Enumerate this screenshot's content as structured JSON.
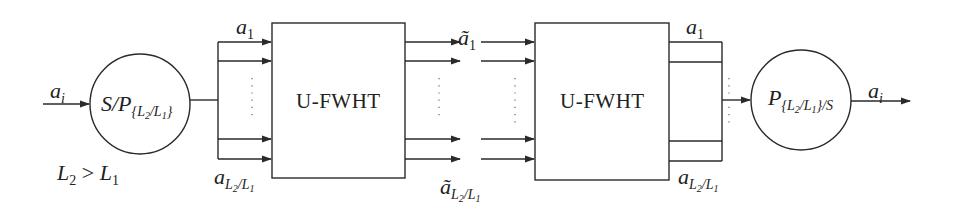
{
  "diagram": {
    "input_label": {
      "base": "a",
      "sub": "i"
    },
    "condition": {
      "l2": "L",
      "l2sub": "2",
      "op": " > ",
      "l1": "L",
      "l1sub": "1"
    },
    "sp_block": {
      "base": "S/P",
      "sub_open": "{",
      "sub_L2": "L",
      "sub_2": "2",
      "sub_slash": "/",
      "sub_L1": "L",
      "sub_1": "1",
      "sub_close": "}"
    },
    "stage1_top_label": {
      "base": "a",
      "sub": "1"
    },
    "stage1_bottom_label": {
      "base": "a",
      "sub_L2": "L",
      "sub_2": "2",
      "sub_slash": "/",
      "sub_L1": "L",
      "sub_1": "1"
    },
    "block1": {
      "label": "U-FWHT"
    },
    "stage2_top_label": {
      "base": "ã",
      "sub": "1"
    },
    "stage2_bottom_label": {
      "base": "ã",
      "sub_L2": "L",
      "sub_2": "2",
      "sub_slash": "/",
      "sub_L1": "L",
      "sub_1": "1"
    },
    "block2": {
      "label": "U-FWHT"
    },
    "stage3_top_label": {
      "base": "a",
      "sub": "1"
    },
    "stage3_bottom_label": {
      "base": "a",
      "sub_L2": "L",
      "sub_2": "2",
      "sub_slash": "/",
      "sub_L1": "L",
      "sub_1": "1"
    },
    "ps_block": {
      "base": "P",
      "sub_open": "{",
      "sub_L2": "L",
      "sub_2": "2",
      "sub_slash": "/",
      "sub_L1": "L",
      "sub_1": "1",
      "sub_close": "}/S"
    },
    "output_label": {
      "base": "a",
      "sub": "i"
    },
    "colors": {
      "stroke": "#2a2a2a",
      "background": "#ffffff"
    }
  }
}
